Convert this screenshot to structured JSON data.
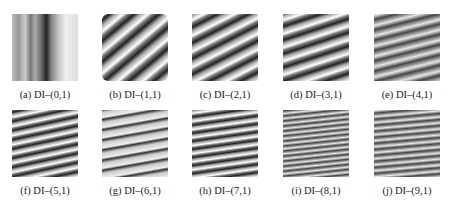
{
  "figure": {
    "panels": [
      {
        "caption": "(a) DI–(0,1)",
        "angle": 90,
        "period": 40,
        "style": "vertical"
      },
      {
        "caption": "(b) DI–(1,1)",
        "angle": -40,
        "period": 16,
        "style": "diag"
      },
      {
        "caption": "(c) DI–(2,1)",
        "angle": -27,
        "period": 14,
        "style": "diag"
      },
      {
        "caption": "(d) DI–(3,1)",
        "angle": -18,
        "period": 13,
        "style": "diag"
      },
      {
        "caption": "(e) DI–(4,1)",
        "angle": -14,
        "period": 10,
        "style": "fine"
      },
      {
        "caption": "(f) DI–(5,1)",
        "angle": -12,
        "period": 9,
        "style": "diag"
      },
      {
        "caption": "(g) DI–(6,1)",
        "angle": -10,
        "period": 10,
        "style": "light"
      },
      {
        "caption": "(h) DI–(7,1)",
        "angle": -8,
        "period": 8,
        "style": "diag"
      },
      {
        "caption": "(i) DI–(8,1)",
        "angle": -6,
        "period": 5,
        "style": "fine"
      },
      {
        "caption": "(j) DI–(9,1)",
        "angle": -5,
        "period": 6,
        "style": "fine"
      }
    ]
  }
}
